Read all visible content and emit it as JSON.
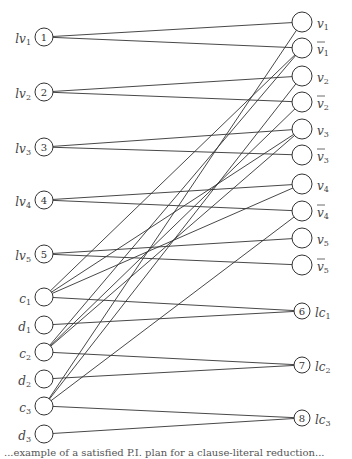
{
  "diagram": {
    "left_nodes": [
      {
        "id": "n1",
        "label": "lv",
        "sub": "1",
        "num": "1",
        "x": 44,
        "y": 37,
        "r": 9
      },
      {
        "id": "n2",
        "label": "lv",
        "sub": "2",
        "num": "2",
        "x": 44,
        "y": 92,
        "r": 9
      },
      {
        "id": "n3",
        "label": "lv",
        "sub": "3",
        "num": "3",
        "x": 44,
        "y": 147,
        "r": 9
      },
      {
        "id": "n4",
        "label": "lv",
        "sub": "4",
        "num": "4",
        "x": 44,
        "y": 200,
        "r": 9
      },
      {
        "id": "n5",
        "label": "lv",
        "sub": "5",
        "num": "5",
        "x": 44,
        "y": 254,
        "r": 9
      },
      {
        "id": "c1",
        "label": "c",
        "sub": "1",
        "num": "",
        "x": 44,
        "y": 297,
        "r": 9
      },
      {
        "id": "d1",
        "label": "d",
        "sub": "1",
        "num": "",
        "x": 44,
        "y": 325,
        "r": 9
      },
      {
        "id": "c2",
        "label": "c",
        "sub": "2",
        "num": "",
        "x": 44,
        "y": 352,
        "r": 9
      },
      {
        "id": "d2",
        "label": "d",
        "sub": "2",
        "num": "",
        "x": 44,
        "y": 379,
        "r": 9
      },
      {
        "id": "c3",
        "label": "c",
        "sub": "3",
        "num": "",
        "x": 44,
        "y": 406,
        "r": 9
      },
      {
        "id": "d3",
        "label": "d",
        "sub": "3",
        "num": "",
        "x": 44,
        "y": 434,
        "r": 9
      }
    ],
    "right_nodes": [
      {
        "id": "v1",
        "label": "v",
        "sub": "1",
        "bar": false,
        "num": "",
        "x": 302,
        "y": 22,
        "r": 10
      },
      {
        "id": "nv1",
        "label": "v",
        "sub": "1",
        "bar": true,
        "num": "",
        "x": 302,
        "y": 48,
        "r": 10
      },
      {
        "id": "v2",
        "label": "v",
        "sub": "2",
        "bar": false,
        "num": "",
        "x": 302,
        "y": 76,
        "r": 10
      },
      {
        "id": "nv2",
        "label": "v",
        "sub": "2",
        "bar": true,
        "num": "",
        "x": 302,
        "y": 102,
        "r": 10
      },
      {
        "id": "v3",
        "label": "v",
        "sub": "3",
        "bar": false,
        "num": "",
        "x": 302,
        "y": 129,
        "r": 10
      },
      {
        "id": "nv3",
        "label": "v",
        "sub": "3",
        "bar": true,
        "num": "",
        "x": 302,
        "y": 155,
        "r": 10
      },
      {
        "id": "v4",
        "label": "v",
        "sub": "4",
        "bar": false,
        "num": "",
        "x": 302,
        "y": 184,
        "r": 10
      },
      {
        "id": "nv4",
        "label": "v",
        "sub": "4",
        "bar": true,
        "num": "",
        "x": 302,
        "y": 211,
        "r": 10
      },
      {
        "id": "v5",
        "label": "v",
        "sub": "5",
        "bar": false,
        "num": "",
        "x": 302,
        "y": 238,
        "r": 10
      },
      {
        "id": "nv5",
        "label": "v",
        "sub": "5",
        "bar": true,
        "num": "",
        "x": 302,
        "y": 265,
        "r": 10
      },
      {
        "id": "n6",
        "label": "lc",
        "sub": "1",
        "bar": false,
        "num": "6",
        "x": 302,
        "y": 311,
        "r": 8
      },
      {
        "id": "n7",
        "label": "lc",
        "sub": "2",
        "bar": false,
        "num": "7",
        "x": 302,
        "y": 365,
        "r": 8
      },
      {
        "id": "n8",
        "label": "lc",
        "sub": "3",
        "bar": false,
        "num": "8",
        "x": 302,
        "y": 418,
        "r": 8
      }
    ],
    "edges": [
      [
        "n1",
        "v1"
      ],
      [
        "n1",
        "nv1"
      ],
      [
        "n2",
        "v2"
      ],
      [
        "n2",
        "nv2"
      ],
      [
        "n3",
        "v3"
      ],
      [
        "n3",
        "nv3"
      ],
      [
        "n4",
        "v4"
      ],
      [
        "n4",
        "nv4"
      ],
      [
        "n5",
        "v5"
      ],
      [
        "n5",
        "nv5"
      ],
      [
        "c1",
        "nv1"
      ],
      [
        "c1",
        "v3"
      ],
      [
        "c1",
        "v4"
      ],
      [
        "c1",
        "n6"
      ],
      [
        "d1",
        "n6"
      ],
      [
        "c2",
        "nv1"
      ],
      [
        "c2",
        "nv2"
      ],
      [
        "c2",
        "v3"
      ],
      [
        "c2",
        "n7"
      ],
      [
        "d2",
        "n7"
      ],
      [
        "c3",
        "v1"
      ],
      [
        "c3",
        "v2"
      ],
      [
        "c3",
        "nv4"
      ],
      [
        "c3",
        "n8"
      ],
      [
        "d3",
        "n8"
      ]
    ]
  },
  "caption": "...example of a satisfied P.I. plan for a clause-literal reduction..."
}
